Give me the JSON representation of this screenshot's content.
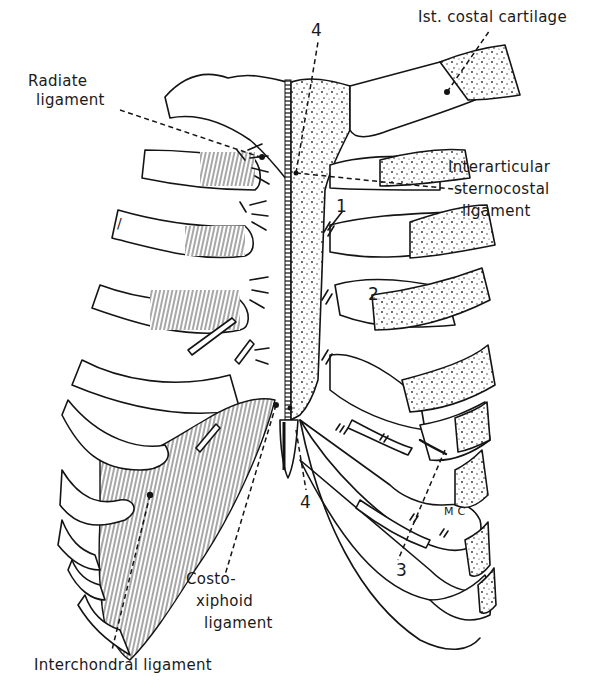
{
  "figure": {
    "style": "black line-art anatomical drawing",
    "colors": {
      "ink": "#141414",
      "background": "#ffffff"
    }
  },
  "labels": {
    "costal_cartilage_1": "Ist. costal cartilage",
    "radiate_ligament_line1": "Radiate",
    "radiate_ligament_line2": "ligament",
    "interarticular_line1": "Interarticular",
    "interarticular_line2": "sternocostal",
    "interarticular_line3": "ligament",
    "costoxiphoid_line1": "Costo-",
    "costoxiphoid_line2": "xiphoid",
    "costoxiphoid_line3": "ligament",
    "interchondral": "Interchondral ligament"
  },
  "numbers": {
    "n4_top": "4",
    "n4_bottom": "4",
    "n1": "1",
    "n2": "2",
    "n3": "3",
    "mc": "M C",
    "left_mark": "/"
  }
}
